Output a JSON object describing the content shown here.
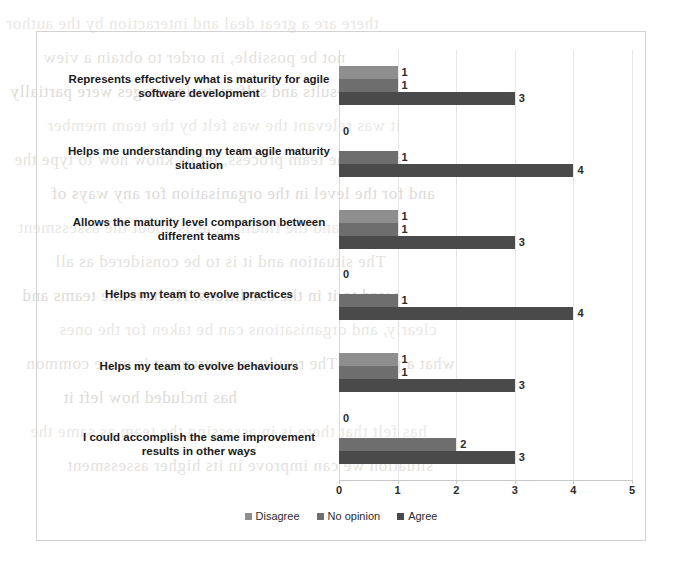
{
  "chart_data": {
    "type": "bar",
    "orientation": "horizontal",
    "title": "",
    "xlabel": "",
    "ylabel": "",
    "xlim": [
      0,
      5
    ],
    "xticks": [
      "0",
      "1",
      "2",
      "3",
      "4",
      "5"
    ],
    "grid": true,
    "legend_position": "bottom",
    "categories": [
      "Represents effectively what is maturity for agile software development",
      "Helps me understanding my team agile maturity situation",
      "Allows the maturity level comparison between different teams",
      "Helps my team to evolve practices",
      "Helps my team to evolve behaviours",
      "I could accomplish the same improvement results in other ways"
    ],
    "series": [
      {
        "name": "Disagree",
        "color": "#8e8e8e",
        "values": [
          1,
          0,
          1,
          0,
          1,
          0
        ]
      },
      {
        "name": "No opinion",
        "color": "#6e6e6e",
        "values": [
          1,
          1,
          1,
          1,
          1,
          2
        ]
      },
      {
        "name": "Agree",
        "color": "#4a4a4a",
        "values": [
          3,
          4,
          3,
          4,
          3,
          3
        ]
      }
    ],
    "data_labels": [
      [
        "1",
        "1",
        "3"
      ],
      [
        "0",
        "1",
        "4"
      ],
      [
        "1",
        "1",
        "3"
      ],
      [
        "0",
        "1",
        "4"
      ],
      [
        "1",
        "1",
        "3"
      ],
      [
        "0",
        "2",
        "3"
      ]
    ]
  },
  "bleed_through": [
    "there are a great deal and interaction by the author",
    "not be possible, in order to obtain a view",
    "results and self-maturing stages were partially",
    "it was relevant the was felt by the team member",
    "and in the team process, let us know how to type the",
    "and for the level in the organisation for any ways of",
    "plus and the findings, as is about the assessment",
    "The situation and it is to be considered as all",
    "word to it in the conditions. He have the teams and",
    "clearly, and organisations can be taken for the ones",
    "what a priority. The results measurement is more common",
    "has included how left it",
    "has felt that there is in assessing the team as same the",
    "situation we can improve in its higher assessment"
  ]
}
